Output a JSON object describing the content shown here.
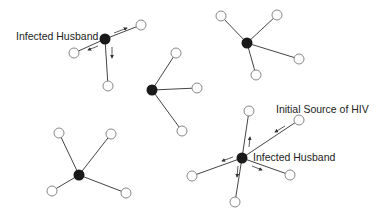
{
  "diagram": {
    "title": "",
    "colors": {
      "edge": "#444444",
      "infected_node": "#1a1a1a",
      "uninfected_node_stroke": "#888888",
      "background": "#ffffff"
    },
    "labels": {
      "infected_husband_1": "Infected Husband",
      "initial_source": "Initial Source of HIV",
      "infected_husband_2": "Infected Husband"
    },
    "clusters": [
      {
        "id": "c1",
        "center": [
          105,
          39
        ],
        "infected": true,
        "partners": [
          [
            141,
            25
          ],
          [
            74,
            53
          ],
          [
            108,
            86
          ]
        ],
        "transmission_arrows": true
      },
      {
        "id": "c2",
        "center": [
          152,
          90
        ],
        "infected": true,
        "partners": [
          [
            176,
            53
          ],
          [
            197,
            88
          ],
          [
            182,
            131
          ]
        ],
        "transmission_arrows": false
      },
      {
        "id": "c3",
        "center": [
          247,
          43
        ],
        "infected": true,
        "partners": [
          [
            221,
            16
          ],
          [
            277,
            15
          ],
          [
            299,
            59
          ],
          [
            256,
            75
          ]
        ],
        "transmission_arrows": false
      },
      {
        "id": "c4",
        "center": [
          79,
          175
        ],
        "infected": true,
        "partners": [
          [
            59,
            133
          ],
          [
            111,
            134
          ],
          [
            52,
            191
          ],
          [
            126,
            193
          ]
        ],
        "transmission_arrows": false
      },
      {
        "id": "c5",
        "center": [
          242,
          158
        ],
        "infected": true,
        "partners": [
          [
            249,
            111
          ],
          [
            299,
            120
          ],
          [
            192,
            176
          ],
          [
            290,
            175
          ],
          [
            235,
            202
          ]
        ],
        "transmission_arrows": true
      }
    ]
  }
}
